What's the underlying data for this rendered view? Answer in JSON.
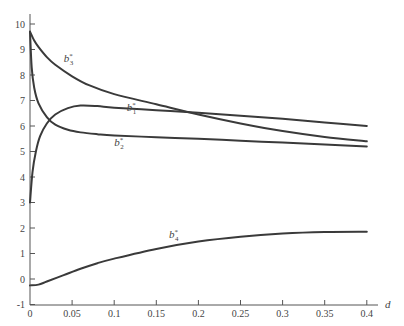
{
  "chart_data": {
    "type": "line",
    "title": "",
    "xlabel": "d",
    "ylabel": "",
    "xlim": [
      0,
      0.4
    ],
    "ylim": [
      -1,
      10
    ],
    "grid": false,
    "legend": "inline labels",
    "x_ticks": [
      "0",
      "0.05",
      "0.1",
      "0.15",
      "0.2",
      "0.25",
      "0.3",
      "0.35",
      "0.4"
    ],
    "y_ticks": [
      "-1",
      "0",
      "1",
      "2",
      "3",
      "4",
      "5",
      "6",
      "7",
      "8",
      "9",
      "10"
    ],
    "series": [
      {
        "name": "b1*",
        "label_main": "b",
        "label_sub": "1",
        "x": [
          0,
          0.003,
          0.007,
          0.012,
          0.02,
          0.03,
          0.045,
          0.06,
          0.08,
          0.1,
          0.15,
          0.2,
          0.25,
          0.3,
          0.35,
          0.4
        ],
        "values": [
          3.0,
          4.2,
          5.0,
          5.6,
          6.1,
          6.45,
          6.7,
          6.8,
          6.78,
          6.72,
          6.62,
          6.52,
          6.4,
          6.28,
          6.14,
          6.0
        ]
      },
      {
        "name": "b2*",
        "label_main": "b",
        "label_sub": "2",
        "x": [
          0,
          0.002,
          0.005,
          0.01,
          0.02,
          0.03,
          0.045,
          0.06,
          0.08,
          0.1,
          0.15,
          0.2,
          0.25,
          0.3,
          0.35,
          0.4
        ],
        "values": [
          9.7,
          8.3,
          7.5,
          6.9,
          6.35,
          6.05,
          5.85,
          5.75,
          5.68,
          5.63,
          5.56,
          5.5,
          5.42,
          5.35,
          5.27,
          5.2
        ]
      },
      {
        "name": "b3*",
        "label_main": "b",
        "label_sub": "3",
        "x": [
          0,
          0.005,
          0.01,
          0.02,
          0.03,
          0.05,
          0.07,
          0.1,
          0.15,
          0.2,
          0.25,
          0.3,
          0.35,
          0.4
        ],
        "values": [
          9.7,
          9.35,
          9.1,
          8.7,
          8.4,
          7.95,
          7.6,
          7.25,
          6.85,
          6.45,
          6.1,
          5.8,
          5.57,
          5.4
        ]
      },
      {
        "name": "b4*",
        "label_main": "b",
        "label_sub": "4",
        "x": [
          0,
          0.01,
          0.02,
          0.04,
          0.06,
          0.08,
          0.1,
          0.15,
          0.2,
          0.25,
          0.3,
          0.35,
          0.4
        ],
        "values": [
          -0.25,
          -0.22,
          -0.1,
          0.15,
          0.4,
          0.62,
          0.8,
          1.18,
          1.47,
          1.66,
          1.78,
          1.84,
          1.85
        ]
      }
    ],
    "annotations": [
      {
        "text": "b3*",
        "x": 0.04,
        "y": 8.5
      },
      {
        "text": "b1*",
        "x": 0.115,
        "y": 6.6
      },
      {
        "text": "b2*",
        "x": 0.1,
        "y": 5.2
      },
      {
        "text": "b4*",
        "x": 0.165,
        "y": 1.6
      }
    ]
  }
}
